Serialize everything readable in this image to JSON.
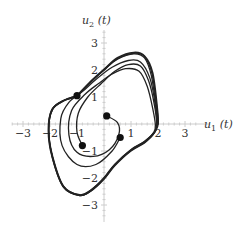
{
  "chart_data": {
    "type": "line",
    "subtype": "phase-portrait",
    "title": "",
    "xlabel": "u1(t)",
    "ylabel": "u2(t)",
    "xlim": [
      -3.4,
      3.4
    ],
    "ylim": [
      -3.4,
      3.4
    ],
    "x_ticks": [
      -3,
      -2,
      -1,
      1,
      2,
      3
    ],
    "y_ticks": [
      -3,
      -2,
      -1,
      1,
      2,
      3
    ],
    "grid": false,
    "legend": null,
    "initial_points": [
      {
        "x": -1.0,
        "y": 1.05
      },
      {
        "x": 0.1,
        "y": 0.3
      },
      {
        "x": -0.8,
        "y": -0.8
      },
      {
        "x": 0.6,
        "y": -0.5
      }
    ],
    "series": [
      {
        "name": "trajectory-from-(0.1,0.3)",
        "points": [
          [
            0.1,
            0.3
          ],
          [
            0.5,
            0.05
          ],
          [
            0.55,
            -0.4
          ],
          [
            0.2,
            -0.95
          ],
          [
            -0.4,
            -1.2
          ],
          [
            -1.0,
            -1.05
          ],
          [
            -1.3,
            -0.4
          ],
          [
            -1.2,
            0.5
          ],
          [
            -0.7,
            1.1
          ],
          [
            -0.2,
            1.5
          ],
          [
            0.3,
            1.85
          ],
          [
            0.8,
            2.05
          ],
          [
            1.3,
            1.95
          ],
          [
            1.6,
            1.4
          ],
          [
            1.8,
            0.6
          ],
          [
            1.9,
            0.0
          ],
          [
            1.85,
            -0.3
          ],
          [
            1.5,
            -0.65
          ],
          [
            1.0,
            -0.95
          ],
          [
            0.4,
            -1.5
          ],
          [
            0.0,
            -2.0
          ],
          [
            -0.5,
            -2.45
          ],
          [
            -0.9,
            -2.62
          ],
          [
            -1.5,
            -2.3
          ],
          [
            -1.9,
            -1.2
          ],
          [
            -2.05,
            -0.2
          ],
          [
            -1.9,
            0.55
          ],
          [
            -1.5,
            0.85
          ],
          [
            -1.0,
            1.05
          ],
          [
            -0.5,
            1.55
          ],
          [
            0.0,
            2.0
          ],
          [
            0.5,
            2.4
          ],
          [
            1.1,
            2.6
          ],
          [
            1.5,
            2.45
          ],
          [
            1.75,
            1.8
          ],
          [
            1.95,
            0.5
          ],
          [
            2.0,
            0.0
          ]
        ]
      },
      {
        "name": "trajectory-from-(-0.8,-0.8)",
        "points": [
          [
            -0.8,
            -0.8
          ],
          [
            -1.0,
            -0.3
          ],
          [
            -0.95,
            0.4
          ],
          [
            -0.6,
            1.0
          ],
          [
            -0.1,
            1.5
          ],
          [
            0.4,
            1.95
          ],
          [
            0.9,
            2.2
          ],
          [
            1.35,
            2.15
          ],
          [
            1.65,
            1.6
          ],
          [
            1.85,
            0.8
          ],
          [
            1.95,
            0.0
          ],
          [
            1.85,
            -0.35
          ],
          [
            1.5,
            -0.7
          ],
          [
            1.0,
            -1.0
          ],
          [
            0.4,
            -1.55
          ],
          [
            0.0,
            -2.05
          ],
          [
            -0.5,
            -2.5
          ],
          [
            -0.9,
            -2.65
          ],
          [
            -1.5,
            -2.35
          ],
          [
            -1.9,
            -1.3
          ],
          [
            -2.05,
            -0.3
          ],
          [
            -1.95,
            0.5
          ],
          [
            -1.55,
            0.85
          ],
          [
            -1.0,
            1.05
          ],
          [
            -0.5,
            1.55
          ],
          [
            0.0,
            2.0
          ],
          [
            0.5,
            2.42
          ],
          [
            1.1,
            2.62
          ],
          [
            1.5,
            2.5
          ],
          [
            1.78,
            1.85
          ],
          [
            1.97,
            0.5
          ],
          [
            2.0,
            0.0
          ]
        ]
      },
      {
        "name": "trajectory-from-(0.6,-0.5)",
        "points": [
          [
            0.6,
            -0.5
          ],
          [
            0.3,
            -1.0
          ],
          [
            -0.3,
            -1.5
          ],
          [
            -1.0,
            -1.5
          ],
          [
            -1.55,
            -0.8
          ],
          [
            -1.6,
            0.2
          ],
          [
            -1.3,
            0.8
          ],
          [
            -0.8,
            1.2
          ],
          [
            -0.3,
            1.65
          ],
          [
            0.3,
            2.1
          ],
          [
            0.9,
            2.35
          ],
          [
            1.35,
            2.3
          ],
          [
            1.7,
            1.7
          ],
          [
            1.9,
            0.7
          ],
          [
            1.95,
            0.0
          ],
          [
            1.85,
            -0.35
          ],
          [
            1.5,
            -0.68
          ],
          [
            1.0,
            -0.98
          ],
          [
            0.4,
            -1.52
          ],
          [
            0.0,
            -2.02
          ],
          [
            -0.5,
            -2.48
          ],
          [
            -0.9,
            -2.64
          ],
          [
            -1.5,
            -2.33
          ],
          [
            -1.9,
            -1.25
          ],
          [
            -2.05,
            -0.25
          ],
          [
            -1.92,
            0.52
          ],
          [
            -1.52,
            0.86
          ],
          [
            -1.0,
            1.05
          ]
        ]
      },
      {
        "name": "trajectory-from-(-1.0,1.05)",
        "points": [
          [
            -1.0,
            1.05
          ],
          [
            -0.5,
            1.57
          ],
          [
            0.0,
            2.02
          ],
          [
            0.5,
            2.45
          ],
          [
            1.1,
            2.65
          ],
          [
            1.5,
            2.52
          ],
          [
            1.8,
            1.9
          ],
          [
            1.98,
            0.5
          ],
          [
            2.0,
            0.0
          ],
          [
            1.88,
            -0.3
          ],
          [
            1.5,
            -0.66
          ],
          [
            1.0,
            -0.96
          ],
          [
            0.4,
            -1.5
          ],
          [
            0.0,
            -2.0
          ],
          [
            -0.5,
            -2.47
          ],
          [
            -0.9,
            -2.64
          ],
          [
            -1.5,
            -2.32
          ],
          [
            -1.92,
            -1.22
          ],
          [
            -2.06,
            -0.22
          ],
          [
            -1.92,
            0.54
          ],
          [
            -1.5,
            0.86
          ],
          [
            -1.0,
            1.05
          ]
        ]
      }
    ]
  }
}
